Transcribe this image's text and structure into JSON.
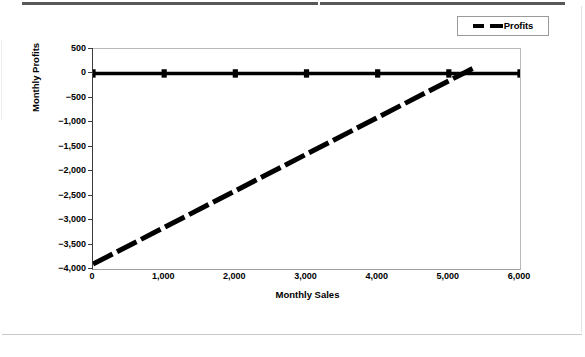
{
  "chart_data": {
    "type": "line",
    "title": "",
    "xlabel": "Monthly Sales",
    "ylabel": "Monthly Profits",
    "xlim": [
      0,
      6000
    ],
    "ylim": [
      -4000,
      500
    ],
    "xticks": [
      "0",
      "1,000",
      "2,000",
      "3,000",
      "4,000",
      "5,000",
      "6,000"
    ],
    "xtick_values": [
      0,
      1000,
      2000,
      3000,
      4000,
      5000,
      6000
    ],
    "yticks": [
      "500",
      "0",
      "-500",
      "-1,000",
      "-1,500",
      "-2,000",
      "-2,500",
      "-3,000",
      "-3,500",
      "-4,000"
    ],
    "ytick_values": [
      500,
      0,
      -500,
      -1000,
      -1500,
      -2000,
      -2500,
      -3000,
      -3500,
      -4000
    ],
    "grid": false,
    "legend_position": "top-right",
    "series": [
      {
        "name": "zero-baseline",
        "style": "solid",
        "marker": "square",
        "color": "#000000",
        "show_in_legend": false,
        "x": [
          0,
          1000,
          2000,
          3000,
          4000,
          5000,
          6000
        ],
        "values": [
          0,
          0,
          0,
          0,
          0,
          0,
          0
        ]
      },
      {
        "name": "Profits",
        "style": "dashed",
        "marker": "none",
        "color": "#000000",
        "show_in_legend": true,
        "x": [
          0,
          1000,
          2000,
          3000,
          4000,
          5000,
          5200,
          5350
        ],
        "values": [
          -3900,
          -3150,
          -2400,
          -1650,
          -900,
          -150,
          0,
          112
        ]
      }
    ]
  },
  "legend": {
    "entries": [
      {
        "label": "Profits",
        "marker": "dashed-line-swatch"
      }
    ]
  },
  "axes": {
    "x_title": "Monthly Sales",
    "y_title": "Monthly Profits"
  },
  "page": {
    "top_rule": "horizontal-rule",
    "bottom_rule": "horizontal-rule"
  }
}
